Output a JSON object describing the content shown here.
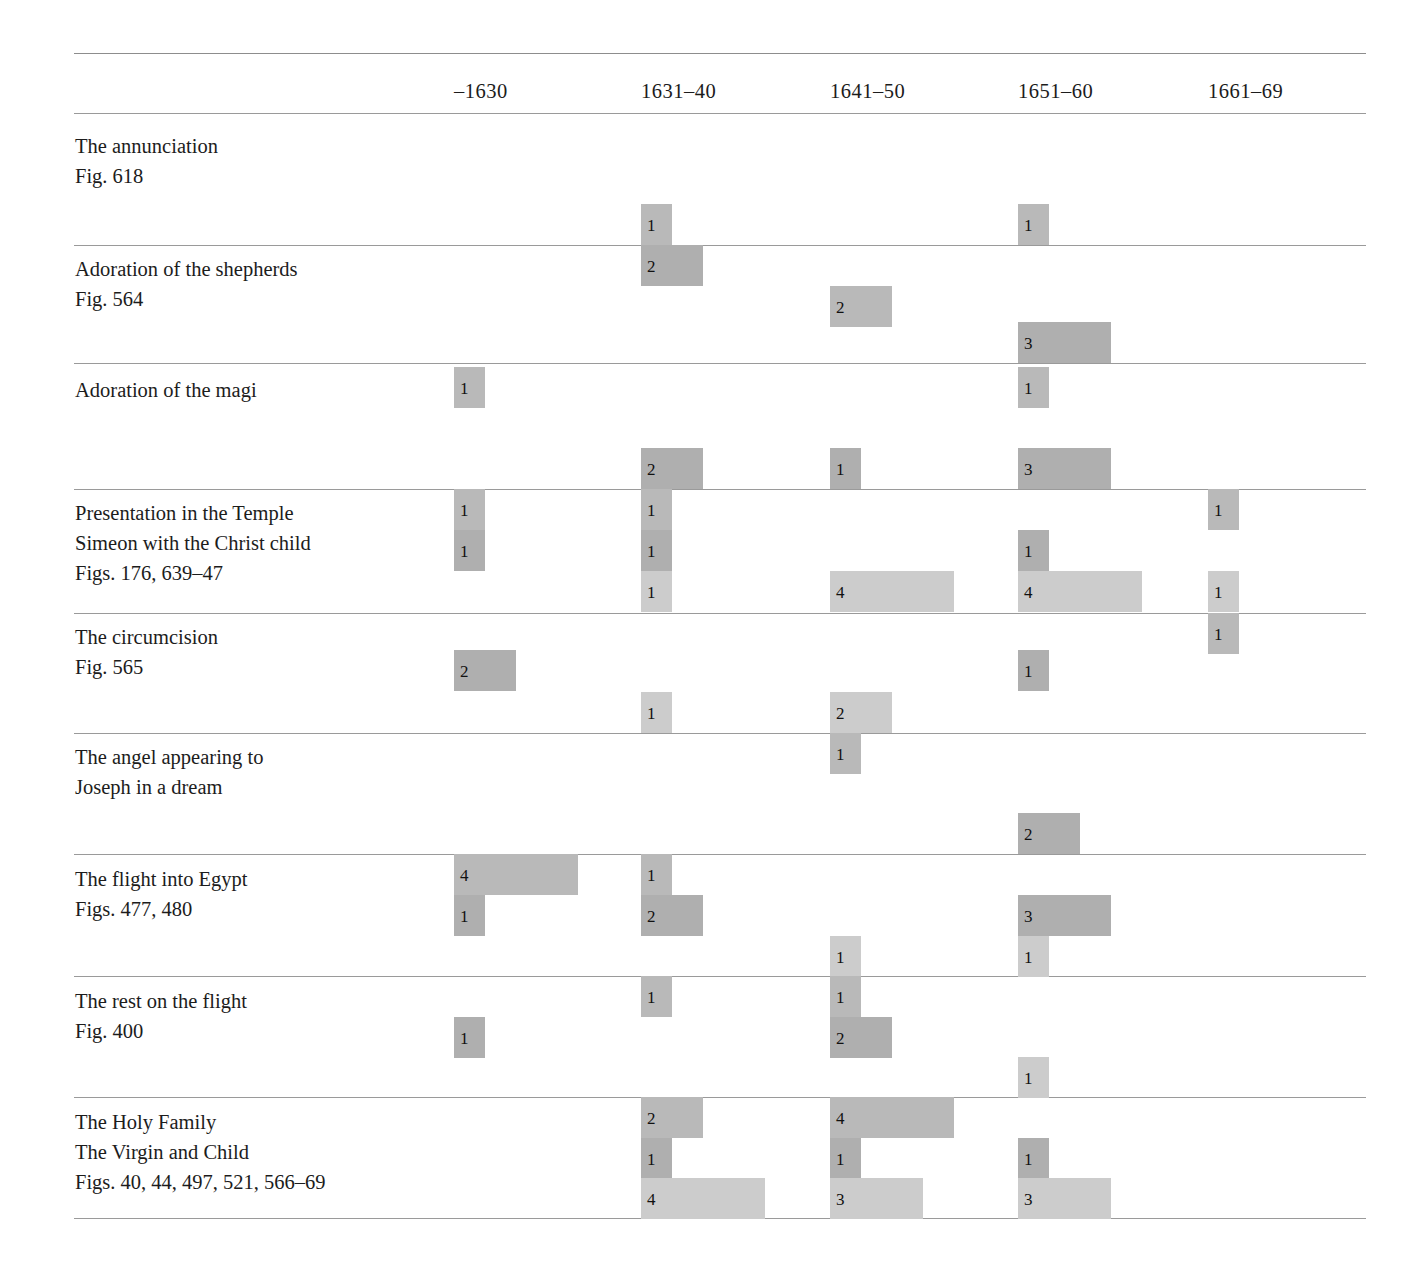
{
  "table": {
    "caption": "Chronological distribution of Rembrandt's treatments of Infancy of Christ subjects",
    "geometry": {
      "left": 74,
      "right": 1366,
      "col_starts": [
        454,
        641,
        830,
        1018,
        1208
      ],
      "unit_width": 31,
      "bar_height": 41
    },
    "colors": {
      "tier1": "#b9b9b9",
      "tier2": "#afafaf",
      "tier3": "#cccccc",
      "rule": "#9a9a9a",
      "text": "#1c1c1c",
      "background": "#ffffff"
    },
    "columns": [
      {
        "label": "–1630"
      },
      {
        "label": "1631–40"
      },
      {
        "label": "1641–50"
      },
      {
        "label": "1651–60"
      },
      {
        "label": "1661–69"
      }
    ],
    "rules_y": [
      53,
      113,
      245,
      363,
      489,
      613,
      733,
      854,
      976,
      1097,
      1218
    ],
    "header_y": 80,
    "rows": [
      {
        "label_lines": [
          "The annunciation",
          "Fig. 618"
        ],
        "label_y": 131,
        "tiers": [
          {
            "y": 204,
            "bars": [
              {
                "col": 1,
                "value": 1,
                "text": "1"
              },
              {
                "col": 3,
                "value": 1,
                "text": "1"
              }
            ]
          },
          {
            "y": 245,
            "bars": [
              {
                "col": 1,
                "value": 2,
                "text": "2"
              }
            ]
          },
          {
            "y": 286,
            "bars": []
          }
        ]
      },
      {
        "label_lines": [
          "Adoration of the shepherds",
          "Fig. 564"
        ],
        "label_y": 254,
        "tiers": [
          {
            "y": 286,
            "bars": [
              {
                "col": 2,
                "value": 2,
                "text": "2"
              }
            ]
          },
          {
            "y": 322,
            "bars": [
              {
                "col": 3,
                "value": 3,
                "text": "3"
              }
            ]
          },
          {
            "y": 363,
            "bars": []
          }
        ]
      },
      {
        "label_lines": [
          "Adoration of the magi"
        ],
        "label_y": 375,
        "tiers": [
          {
            "y": 367,
            "bars": [
              {
                "col": 0,
                "value": 1,
                "text": "1"
              },
              {
                "col": 3,
                "value": 1,
                "text": "1"
              }
            ]
          },
          {
            "y": 448,
            "bars": [
              {
                "col": 1,
                "value": 2,
                "text": "2"
              },
              {
                "col": 2,
                "value": 1,
                "text": "1"
              },
              {
                "col": 3,
                "value": 3,
                "text": "3"
              }
            ]
          },
          {
            "y": 489,
            "bars": []
          }
        ]
      },
      {
        "label_lines": [
          "Presentation in the Temple",
          "Simeon with the Christ child",
          "Figs. 176, 639–47"
        ],
        "label_y": 498,
        "tiers": [
          {
            "y": 489,
            "bars": [
              {
                "col": 0,
                "value": 1,
                "text": "1"
              },
              {
                "col": 1,
                "value": 1,
                "text": "1"
              },
              {
                "col": 4,
                "value": 1,
                "text": "1"
              }
            ]
          },
          {
            "y": 530,
            "bars": [
              {
                "col": 0,
                "value": 1,
                "text": "1"
              },
              {
                "col": 1,
                "value": 1,
                "text": "1"
              },
              {
                "col": 3,
                "value": 1,
                "text": "1"
              }
            ]
          },
          {
            "y": 571,
            "bars": [
              {
                "col": 1,
                "value": 1,
                "text": "1"
              },
              {
                "col": 2,
                "value": 4,
                "text": "4"
              },
              {
                "col": 3,
                "value": 4,
                "text": "4"
              },
              {
                "col": 4,
                "value": 1,
                "text": "1"
              }
            ]
          }
        ]
      },
      {
        "label_lines": [
          "The circumcision",
          "Fig. 565"
        ],
        "label_y": 622,
        "tiers": [
          {
            "y": 613,
            "bars": [
              {
                "col": 4,
                "value": 1,
                "text": "1"
              }
            ]
          },
          {
            "y": 650,
            "bars": [
              {
                "col": 0,
                "value": 2,
                "text": "2"
              },
              {
                "col": 3,
                "value": 1,
                "text": "1"
              }
            ]
          },
          {
            "y": 692,
            "bars": [
              {
                "col": 1,
                "value": 1,
                "text": "1"
              },
              {
                "col": 2,
                "value": 2,
                "text": "2"
              }
            ]
          }
        ]
      },
      {
        "label_lines": [
          "The angel appearing to",
          "Joseph in a dream"
        ],
        "label_y": 742,
        "tiers": [
          {
            "y": 733,
            "bars": [
              {
                "col": 2,
                "value": 1,
                "text": "1"
              }
            ]
          },
          {
            "y": 813,
            "bars": [
              {
                "col": 3,
                "value": 2,
                "text": "2"
              }
            ]
          },
          {
            "y": 854,
            "bars": []
          }
        ]
      },
      {
        "label_lines": [
          "The flight into Egypt",
          "Figs. 477, 480"
        ],
        "label_y": 864,
        "tiers": [
          {
            "y": 854,
            "bars": [
              {
                "col": 0,
                "value": 4,
                "text": "4"
              },
              {
                "col": 1,
                "value": 1,
                "text": "1"
              }
            ]
          },
          {
            "y": 895,
            "bars": [
              {
                "col": 0,
                "value": 1,
                "text": "1"
              },
              {
                "col": 1,
                "value": 2,
                "text": "2"
              },
              {
                "col": 3,
                "value": 3,
                "text": "3"
              }
            ]
          },
          {
            "y": 936,
            "bars": [
              {
                "col": 2,
                "value": 1,
                "text": "1"
              },
              {
                "col": 3,
                "value": 1,
                "text": "1"
              }
            ]
          }
        ]
      },
      {
        "label_lines": [
          "The rest on the flight",
          "Fig. 400"
        ],
        "label_y": 986,
        "tiers": [
          {
            "y": 976,
            "bars": [
              {
                "col": 1,
                "value": 1,
                "text": "1"
              },
              {
                "col": 2,
                "value": 1,
                "text": "1"
              }
            ]
          },
          {
            "y": 1017,
            "bars": [
              {
                "col": 0,
                "value": 1,
                "text": "1"
              },
              {
                "col": 2,
                "value": 2,
                "text": "2"
              }
            ]
          },
          {
            "y": 1057,
            "bars": [
              {
                "col": 3,
                "value": 1,
                "text": "1"
              }
            ]
          }
        ]
      },
      {
        "label_lines": [
          "The Holy Family",
          "The Virgin and Child",
          "Figs. 40, 44, 497, 521, 566–69"
        ],
        "label_y": 1107,
        "tiers": [
          {
            "y": 1097,
            "bars": [
              {
                "col": 1,
                "value": 2,
                "text": "2"
              },
              {
                "col": 2,
                "value": 4,
                "text": "4"
              }
            ]
          },
          {
            "y": 1138,
            "bars": [
              {
                "col": 1,
                "value": 1,
                "text": "1"
              },
              {
                "col": 2,
                "value": 1,
                "text": "1"
              },
              {
                "col": 3,
                "value": 1,
                "text": "1"
              }
            ]
          },
          {
            "y": 1178,
            "bars": [
              {
                "col": 1,
                "value": 4,
                "text": "4"
              },
              {
                "col": 2,
                "value": 3,
                "text": "3"
              },
              {
                "col": 3,
                "value": 3,
                "text": "3"
              }
            ]
          }
        ]
      }
    ]
  },
  "chart_data": {
    "type": "bar",
    "xlabel": "Decade",
    "ylabel": "Subject",
    "categories": [
      "–1630",
      "1631–40",
      "1641–50",
      "1651–60",
      "1661–69"
    ],
    "tier_count": 3,
    "orientation": "horizontal",
    "legend": [],
    "grid": false,
    "value_range": [
      0,
      4
    ],
    "rows": [
      {
        "subject": "The annunciation",
        "figures": "Fig. 618",
        "tiers": [
          [
            0,
            1,
            0,
            1,
            0
          ],
          [
            0,
            2,
            0,
            0,
            0
          ],
          [
            0,
            0,
            0,
            0,
            0
          ]
        ]
      },
      {
        "subject": "Adoration of the shepherds",
        "figures": "Fig. 564",
        "tiers": [
          [
            0,
            0,
            2,
            0,
            0
          ],
          [
            0,
            0,
            0,
            3,
            0
          ],
          [
            0,
            0,
            0,
            0,
            0
          ]
        ]
      },
      {
        "subject": "Adoration of the magi",
        "figures": "",
        "tiers": [
          [
            1,
            0,
            0,
            1,
            0
          ],
          [
            0,
            2,
            1,
            3,
            0
          ],
          [
            0,
            0,
            0,
            0,
            0
          ]
        ]
      },
      {
        "subject": "Presentation in the Temple / Simeon with the Christ child",
        "figures": "Figs. 176, 639–47",
        "tiers": [
          [
            1,
            1,
            0,
            0,
            1
          ],
          [
            1,
            1,
            0,
            1,
            0
          ],
          [
            0,
            1,
            4,
            4,
            1
          ]
        ]
      },
      {
        "subject": "The circumcision",
        "figures": "Fig. 565",
        "tiers": [
          [
            0,
            0,
            0,
            0,
            1
          ],
          [
            2,
            0,
            0,
            1,
            0
          ],
          [
            0,
            1,
            2,
            0,
            0
          ]
        ]
      },
      {
        "subject": "The angel appearing to Joseph in a dream",
        "figures": "",
        "tiers": [
          [
            0,
            0,
            1,
            0,
            0
          ],
          [
            0,
            0,
            0,
            2,
            0
          ],
          [
            0,
            0,
            0,
            0,
            0
          ]
        ]
      },
      {
        "subject": "The flight into Egypt",
        "figures": "Figs. 477, 480",
        "tiers": [
          [
            4,
            1,
            0,
            0,
            0
          ],
          [
            1,
            2,
            0,
            3,
            0
          ],
          [
            0,
            0,
            1,
            1,
            0
          ]
        ]
      },
      {
        "subject": "The rest on the flight",
        "figures": "Fig. 400",
        "tiers": [
          [
            0,
            1,
            1,
            0,
            0
          ],
          [
            1,
            0,
            2,
            0,
            0
          ],
          [
            0,
            0,
            0,
            1,
            0
          ]
        ]
      },
      {
        "subject": "The Holy Family / The Virgin and Child",
        "figures": "Figs. 40, 44, 497, 521, 566–69",
        "tiers": [
          [
            0,
            2,
            4,
            0,
            0
          ],
          [
            0,
            1,
            1,
            1,
            0
          ],
          [
            0,
            4,
            3,
            3,
            0
          ]
        ]
      }
    ]
  }
}
